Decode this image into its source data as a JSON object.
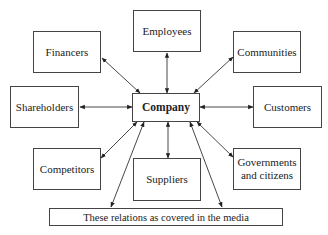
{
  "diagram": {
    "type": "stakeholder-hub",
    "center": {
      "id": "company",
      "label": "Company",
      "x": 132,
      "y": 93,
      "w": 68,
      "h": 29
    },
    "nodes": [
      {
        "id": "employees",
        "label": "Employees",
        "x": 133,
        "y": 10,
        "w": 68,
        "h": 42
      },
      {
        "id": "financers",
        "label": "Financers",
        "x": 33,
        "y": 31,
        "w": 68,
        "h": 42
      },
      {
        "id": "communities",
        "label": "Communities",
        "x": 233,
        "y": 31,
        "w": 68,
        "h": 42
      },
      {
        "id": "shareholders",
        "label": "Shareholders",
        "x": 10,
        "y": 86,
        "w": 69,
        "h": 42
      },
      {
        "id": "customers",
        "label": "Customers",
        "x": 253,
        "y": 86,
        "w": 69,
        "h": 42
      },
      {
        "id": "competitors",
        "label": "Competitors",
        "x": 33,
        "y": 148,
        "w": 68,
        "h": 42
      },
      {
        "id": "suppliers",
        "label": "Suppliers",
        "x": 133,
        "y": 158,
        "w": 68,
        "h": 43
      },
      {
        "id": "governments",
        "label": "Governments and citizens",
        "x": 233,
        "y": 148,
        "w": 68,
        "h": 42
      },
      {
        "id": "media",
        "label": "These relations as covered in the media",
        "x": 49,
        "y": 208,
        "w": 234,
        "h": 18
      }
    ],
    "edges": [
      {
        "from": "company",
        "to": "employees",
        "direction": "both"
      },
      {
        "from": "company",
        "to": "financers",
        "direction": "both"
      },
      {
        "from": "company",
        "to": "communities",
        "direction": "both"
      },
      {
        "from": "company",
        "to": "shareholders",
        "direction": "both"
      },
      {
        "from": "company",
        "to": "customers",
        "direction": "both"
      },
      {
        "from": "company",
        "to": "competitors",
        "direction": "both"
      },
      {
        "from": "company",
        "to": "suppliers",
        "direction": "both"
      },
      {
        "from": "company",
        "to": "governments",
        "direction": "both"
      },
      {
        "from": "company",
        "to": "media",
        "direction": "both",
        "note": "left link"
      },
      {
        "from": "company",
        "to": "media",
        "direction": "both",
        "note": "right link"
      }
    ],
    "colors": {
      "line": "#333333",
      "box_border": "#444444",
      "text": "#222222",
      "background": "#ffffff"
    }
  }
}
